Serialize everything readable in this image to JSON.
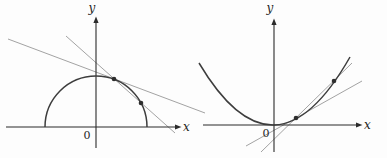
{
  "figure": {
    "background_color": "#fdfdfd",
    "left_graph": {
      "curve": "upper-semicircle",
      "x_axis_label": "x",
      "y_axis_label": "y",
      "origin_label": "0",
      "marked_points_count": 2,
      "lines": [
        "tangent-at-upper-point",
        "secant-through-both-points"
      ]
    },
    "right_graph": {
      "curve": "upward-parabola",
      "x_axis_label": "x",
      "y_axis_label": "y",
      "origin_label": "0",
      "marked_points_count": 2,
      "lines": [
        "tangent-at-lower-point",
        "secant-through-both-points"
      ]
    },
    "colors": {
      "axis": "#2b2b2b",
      "curve": "#3d3d3d",
      "construction_line": "#a3a3a3",
      "point_dot": "#2e2e2e",
      "text": "#1f1f1f"
    }
  }
}
